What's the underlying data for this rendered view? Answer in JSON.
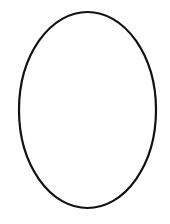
{
  "canvas": {
    "width": 170,
    "height": 224,
    "background": "#ffffff"
  },
  "shape": {
    "type": "ellipse",
    "cx": 87.5,
    "cy": 110,
    "rx": 68.5,
    "ry": 98,
    "stroke": "#111111",
    "stroke_width": 2.2,
    "fill": "none"
  }
}
